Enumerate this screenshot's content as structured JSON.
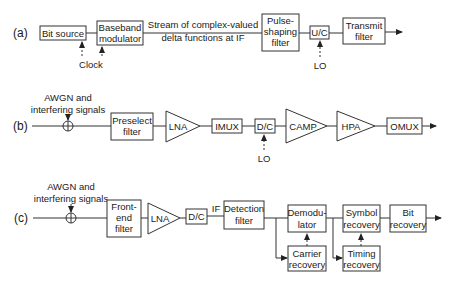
{
  "diagram": {
    "rows": [
      {
        "label": "(a)",
        "blocks": {
          "bit_source": "Bit source",
          "baseband_modulator": [
            "Baseband",
            "modulator"
          ],
          "stream_note": [
            "Stream of complex-valued",
            "delta functions at IF"
          ],
          "pulse_shaping": [
            "Pulse-",
            "shaping",
            "filter"
          ],
          "uc": "U/C",
          "transmit_filter": [
            "Transmit",
            "filter"
          ],
          "clock": "Clock",
          "lo": "LO"
        }
      },
      {
        "label": "(b)",
        "blocks": {
          "noise": [
            "AWGN and",
            "interfering signals"
          ],
          "preselect": [
            "Preselect",
            "filter"
          ],
          "lna": "LNA",
          "imux": "IMUX",
          "dc": "D/C",
          "camp": "CAMP",
          "hpa": "HPA",
          "omux": "OMUX",
          "lo": "LO"
        }
      },
      {
        "label": "(c)",
        "blocks": {
          "noise": [
            "AWGN and",
            "interfering signals"
          ],
          "front_end": [
            "Front-",
            "end",
            "filter"
          ],
          "lna": "LNA",
          "dc": "D/C",
          "if": "IF",
          "detection": [
            "Detection",
            "filter"
          ],
          "demodulator": [
            "Demodu-",
            "lator"
          ],
          "carrier": [
            "Carrier",
            "recovery"
          ],
          "symbol": [
            "Symbol",
            "recovery"
          ],
          "timing": [
            "Timing",
            "recovery"
          ],
          "bit": [
            "Bit",
            "recovery"
          ]
        }
      }
    ]
  }
}
